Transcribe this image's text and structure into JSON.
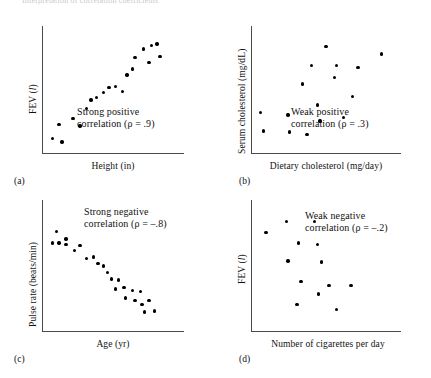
{
  "figure": {
    "top_caption": "Interpretation of correlation coefficients",
    "point_color": "#000000",
    "axis_color": "#4a4a4a",
    "background": "#ffffff"
  },
  "panels": [
    {
      "letter": "(a)",
      "ylabel_prefix": "FEV (",
      "ylabel_italic": "l",
      "ylabel_suffix": ")",
      "xlabel": "Height (in)",
      "annotation_line1": "Strong positive",
      "annotation_line2": "correlation (ρ = .9)"
    },
    {
      "letter": "(b)",
      "ylabel_prefix": "Serum cholesterol (mg/dL)",
      "ylabel_italic": "",
      "ylabel_suffix": "",
      "xlabel": "Dietary cholesterol (mg/day)",
      "annotation_line1": "Weak positive",
      "annotation_line2": "correlation (ρ = .3)"
    },
    {
      "letter": "(c)",
      "ylabel_prefix": "Pulse rate (beats/min)",
      "ylabel_italic": "",
      "ylabel_suffix": "",
      "xlabel": "Age (yr)",
      "annotation_line1": "Strong negative",
      "annotation_line2": "correlation (ρ = –.8)"
    },
    {
      "letter": "(d)",
      "ylabel_prefix": "FEV (",
      "ylabel_italic": "l",
      "ylabel_suffix": ")",
      "xlabel": "Number of cigarettes per day",
      "annotation_line1": "Weak negative",
      "annotation_line2": "correlation (ρ = –.2)"
    }
  ],
  "chart_data": [
    {
      "type": "scatter",
      "panel": "a",
      "title": "Strong positive correlation",
      "xlabel": "Height (in)",
      "ylabel": "FEV (l)",
      "rho": 0.9,
      "xlim": [
        0,
        100
      ],
      "ylim": [
        0,
        100
      ],
      "grid": false,
      "legend": "none",
      "points": [
        [
          6,
          11
        ],
        [
          13,
          8
        ],
        [
          11,
          22
        ],
        [
          21,
          27
        ],
        [
          26,
          21
        ],
        [
          31,
          35
        ],
        [
          34,
          42
        ],
        [
          38,
          44
        ],
        [
          43,
          48
        ],
        [
          47,
          52
        ],
        [
          52,
          53
        ],
        [
          57,
          49
        ],
        [
          60,
          62
        ],
        [
          64,
          67
        ],
        [
          66,
          76
        ],
        [
          72,
          83
        ],
        [
          76,
          72
        ],
        [
          78,
          86
        ],
        [
          82,
          87
        ],
        [
          84,
          77
        ]
      ]
    },
    {
      "type": "scatter",
      "panel": "b",
      "title": "Weak positive correlation",
      "xlabel": "Dietary cholesterol (mg/day)",
      "ylabel": "Serum cholesterol (mg/dL)",
      "rho": 0.3,
      "xlim": [
        0,
        100
      ],
      "ylim": [
        0,
        100
      ],
      "grid": false,
      "legend": "none",
      "points": [
        [
          5,
          32
        ],
        [
          7,
          17
        ],
        [
          24,
          30
        ],
        [
          25,
          16
        ],
        [
          34,
          55
        ],
        [
          37,
          14
        ],
        [
          40,
          70
        ],
        [
          44,
          38
        ],
        [
          46,
          25
        ],
        [
          50,
          85
        ],
        [
          56,
          60
        ],
        [
          57,
          70
        ],
        [
          62,
          28
        ],
        [
          68,
          45
        ],
        [
          72,
          68
        ],
        [
          88,
          79
        ]
      ]
    },
    {
      "type": "scatter",
      "panel": "c",
      "title": "Strong negative correlation",
      "xlabel": "Age (yr)",
      "ylabel": "Pulse rate (beats/min)",
      "rho": -0.8,
      "xlim": [
        0,
        100
      ],
      "ylim": [
        0,
        100
      ],
      "grid": false,
      "legend": "none",
      "points": [
        [
          9,
          77
        ],
        [
          6,
          68
        ],
        [
          11,
          68
        ],
        [
          16,
          71
        ],
        [
          16,
          67
        ],
        [
          22,
          62
        ],
        [
          26,
          66
        ],
        [
          31,
          56
        ],
        [
          36,
          57
        ],
        [
          39,
          52
        ],
        [
          43,
          50
        ],
        [
          46,
          45
        ],
        [
          49,
          40
        ],
        [
          54,
          39
        ],
        [
          52,
          32
        ],
        [
          58,
          33
        ],
        [
          59,
          25
        ],
        [
          64,
          31
        ],
        [
          66,
          23
        ],
        [
          70,
          30
        ],
        [
          71,
          20
        ],
        [
          76,
          23
        ],
        [
          73,
          14
        ],
        [
          80,
          15
        ]
      ]
    },
    {
      "type": "scatter",
      "panel": "d",
      "title": "Weak negative correlation",
      "xlabel": "Number of cigarettes per day",
      "ylabel": "FEV (l)",
      "rho": -0.2,
      "xlim": [
        0,
        100
      ],
      "ylim": [
        0,
        100
      ],
      "grid": false,
      "legend": "none",
      "points": [
        [
          9,
          76
        ],
        [
          23,
          85
        ],
        [
          42,
          85
        ],
        [
          31,
          68
        ],
        [
          44,
          67
        ],
        [
          24,
          54
        ],
        [
          47,
          53
        ],
        [
          33,
          38
        ],
        [
          45,
          28
        ],
        [
          52,
          35
        ],
        [
          67,
          35
        ],
        [
          30,
          20
        ],
        [
          57,
          16
        ]
      ]
    }
  ]
}
